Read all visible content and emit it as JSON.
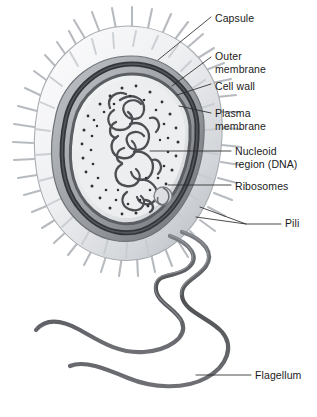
{
  "figure": {
    "background_color": "#ffffff",
    "label_color": "#1b1b1b",
    "leader_line_color": "#2a2a2a",
    "palette": {
      "capsule_light": "#f2f3f4",
      "capsule_mid": "#d8dade",
      "capsule_shadow": "#b9bcc1",
      "pili": "#c3c7cc",
      "pili_edge": "#9aa0a6",
      "outer_membrane_dark": "#3d3f42",
      "cell_wall": "#8e9297",
      "plasma_membrane": "#55585c",
      "cytoplasm": "#e7e8ea",
      "nucleoid": "#4a4c50",
      "ribosome": "#2f3134",
      "flagellum": "#5a5c60"
    },
    "labels": [
      {
        "id": "capsule",
        "text": "Capsule",
        "x": 215,
        "y": 12
      },
      {
        "id": "outer-membrane",
        "text": "Outer\nmembrane",
        "x": 215,
        "y": 50
      },
      {
        "id": "cell-wall",
        "text": "Cell wall",
        "x": 215,
        "y": 80
      },
      {
        "id": "plasma-membrane",
        "text": "Plasma\nmembrane",
        "x": 215,
        "y": 107
      },
      {
        "id": "nucleoid-region",
        "text": "Nucleoid\nregion (DNA)",
        "x": 235,
        "y": 145
      },
      {
        "id": "ribosomes",
        "text": "Ribosomes",
        "x": 235,
        "y": 180
      },
      {
        "id": "pili",
        "text": "Pili",
        "x": 285,
        "y": 222
      },
      {
        "id": "flagellum",
        "text": "Flagellum",
        "x": 255,
        "y": 370
      }
    ]
  }
}
